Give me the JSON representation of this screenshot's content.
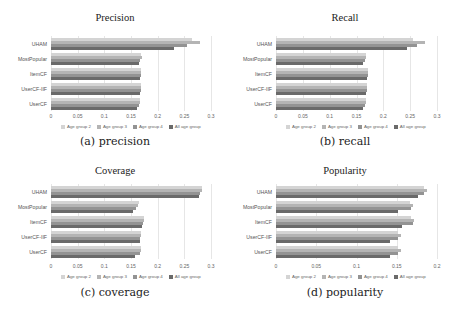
{
  "series_colors": [
    "#d4d4d4",
    "#b4b4b4",
    "#939393",
    "#6a6a6a"
  ],
  "chart_data": [
    {
      "type": "bar",
      "orientation": "horizontal",
      "title": "Precision",
      "caption": "(a) precision",
      "categories": [
        "UHAM",
        "MostPopular",
        "ItemCF",
        "UserCF-IIF",
        "UserCF"
      ],
      "series": [
        {
          "name": "Age group 2",
          "values": [
            0.265,
            0.168,
            0.168,
            0.168,
            0.166
          ]
        },
        {
          "name": "Age group 3",
          "values": [
            0.28,
            0.17,
            0.168,
            0.168,
            0.166
          ]
        },
        {
          "name": "Age group 4",
          "values": [
            0.255,
            0.167,
            0.168,
            0.168,
            0.165
          ]
        },
        {
          "name": "All age group",
          "values": [
            0.23,
            0.165,
            0.167,
            0.167,
            0.162
          ]
        }
      ],
      "xticks": [
        "0",
        "0.05",
        "0.1",
        "0.15",
        "0.2",
        "0.25",
        "0.3"
      ],
      "xlim": [
        0,
        0.3
      ],
      "grid": true,
      "legend_position": "bottom"
    },
    {
      "type": "bar",
      "orientation": "horizontal",
      "title": "Recall",
      "caption": "(b) recall",
      "categories": [
        "UHAM",
        "MostPopular",
        "ItemCF",
        "UserCF-IIF",
        "UserCF"
      ],
      "series": [
        {
          "name": "Age group 2",
          "values": [
            0.255,
            0.168,
            0.172,
            0.17,
            0.168
          ]
        },
        {
          "name": "Age group 3",
          "values": [
            0.278,
            0.168,
            0.172,
            0.17,
            0.168
          ]
        },
        {
          "name": "Age group 4",
          "values": [
            0.263,
            0.166,
            0.171,
            0.169,
            0.166
          ]
        },
        {
          "name": "All age group",
          "values": [
            0.245,
            0.163,
            0.17,
            0.168,
            0.162
          ]
        }
      ],
      "xticks": [
        "0",
        "0.05",
        "0.1",
        "0.15",
        "0.2",
        "0.25",
        "0.3"
      ],
      "xlim": [
        0,
        0.3
      ],
      "grid": true,
      "legend_position": "bottom"
    },
    {
      "type": "bar",
      "orientation": "horizontal",
      "title": "Coverage",
      "caption": "(c) coverage",
      "categories": [
        "UHAM",
        "MostPopular",
        "ItemCF",
        "UserCF-IIF",
        "UserCF"
      ],
      "series": [
        {
          "name": "Age group 2",
          "values": [
            0.283,
            0.165,
            0.175,
            0.168,
            0.168
          ]
        },
        {
          "name": "Age group 3",
          "values": [
            0.283,
            0.164,
            0.175,
            0.168,
            0.168
          ]
        },
        {
          "name": "Age group 4",
          "values": [
            0.28,
            0.16,
            0.172,
            0.167,
            0.166
          ]
        },
        {
          "name": "All age group",
          "values": [
            0.278,
            0.153,
            0.17,
            0.167,
            0.158
          ]
        }
      ],
      "xticks": [
        "0",
        "0.05",
        "0.1",
        "0.15",
        "0.2",
        "0.25",
        "0.3"
      ],
      "xlim": [
        0,
        0.3
      ],
      "grid": true,
      "legend_position": "bottom"
    },
    {
      "type": "bar",
      "orientation": "horizontal",
      "title": "Popularity",
      "caption": "(d) popularity",
      "categories": [
        "UHAM",
        "MostPopular",
        "ItemCF",
        "UserCF-IIF",
        "UserCF"
      ],
      "series": [
        {
          "name": "Age group 2",
          "values": [
            0.184,
            0.166,
            0.168,
            0.152,
            0.152
          ]
        },
        {
          "name": "Age group 3",
          "values": [
            0.188,
            0.17,
            0.172,
            0.155,
            0.155
          ]
        },
        {
          "name": "Age group 4",
          "values": [
            0.184,
            0.168,
            0.17,
            0.152,
            0.152
          ]
        },
        {
          "name": "All age group",
          "values": [
            0.176,
            0.152,
            0.156,
            0.142,
            0.142
          ]
        }
      ],
      "xticks": [
        "0",
        "0.05",
        "0.1",
        "0.15",
        "0.2"
      ],
      "xlim": [
        0,
        0.2
      ],
      "grid": true,
      "legend_position": "bottom"
    }
  ]
}
